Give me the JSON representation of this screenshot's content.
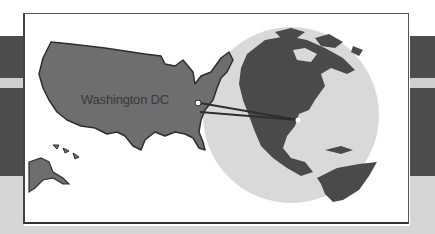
{
  "illustration": {
    "title": "US map linked to globe",
    "location_label": "Washington DC",
    "colors": {
      "land": "#6e6e6e",
      "land_outline": "#2e2e2e",
      "globe_ocean": "#d9d9d9",
      "globe_land": "#4a4a4a",
      "panel_bg": "#ffffff",
      "band_dark": "#4d4d4d",
      "band_light": "#cfcfcf"
    }
  }
}
